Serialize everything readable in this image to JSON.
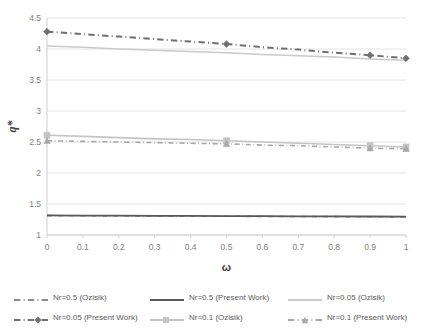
{
  "chart_data": {
    "type": "line",
    "title": "",
    "xlabel": "ω",
    "ylabel": "q*",
    "xlim": [
      0,
      1
    ],
    "ylim": [
      1,
      4.5
    ],
    "ytick_step": 0.5,
    "xtick_step": 0.1,
    "grid": "horizontal",
    "legend_position": "bottom",
    "x": [
      0,
      0.1,
      0.2,
      0.3,
      0.4,
      0.5,
      0.6,
      0.7,
      0.8,
      0.9,
      1
    ],
    "xticks": [
      "0",
      "0.1",
      "0.2",
      "0.3",
      "0.4",
      "0.5",
      "0.6",
      "0.7",
      "0.8",
      "0.9",
      "1"
    ],
    "yticks": [
      "1",
      "1.5",
      "2",
      "2.5",
      "3",
      "3.5",
      "4",
      "4.5"
    ],
    "series": [
      {
        "name": "Nr=0.5 (Ozisik)",
        "color": "#8c8c8c",
        "style": "dash-dot",
        "marker": "none",
        "width": 1.6,
        "values": [
          1.312,
          1.31,
          1.308,
          1.306,
          1.304,
          1.302,
          1.3,
          1.298,
          1.296,
          1.294,
          1.292
        ]
      },
      {
        "name": "Nr=0.5 (Present Work)",
        "color": "#595959",
        "style": "solid",
        "marker": "none",
        "width": 1.8,
        "values": [
          1.316,
          1.314,
          1.312,
          1.31,
          1.308,
          1.306,
          1.304,
          1.302,
          1.3,
          1.298,
          1.296
        ]
      },
      {
        "name": "Nr=0.05 (Ozisik)",
        "color": "#c9c9c9",
        "style": "solid",
        "marker": "none",
        "width": 1.5,
        "values": [
          4.05,
          4.03,
          4.0,
          3.98,
          3.96,
          3.94,
          3.91,
          3.89,
          3.87,
          3.84,
          3.82
        ]
      },
      {
        "name": "Nr=0.05 (Present Work)",
        "color": "#707070",
        "style": "dash-dot",
        "marker": "diamond",
        "width": 2.0,
        "values": [
          4.28,
          4.24,
          4.2,
          4.16,
          4.12,
          4.08,
          4.03,
          3.99,
          3.94,
          3.9,
          3.85
        ],
        "marker_x": [
          0,
          0.5,
          0.9,
          1
        ]
      },
      {
        "name": "Nr=0.1 (Ozisik)",
        "color": "#c4c4c4",
        "style": "solid",
        "marker": "square",
        "width": 1.6,
        "values": [
          2.61,
          2.59,
          2.57,
          2.55,
          2.54,
          2.52,
          2.5,
          2.48,
          2.46,
          2.44,
          2.42
        ],
        "marker_x": [
          0,
          0.5,
          0.9,
          1
        ]
      },
      {
        "name": "Nr=0.1 (Present Work)",
        "color": "#a8a8a8",
        "style": "dash-dot",
        "marker": "triangle",
        "width": 1.6,
        "values": [
          2.52,
          2.51,
          2.5,
          2.49,
          2.48,
          2.47,
          2.45,
          2.44,
          2.42,
          2.4,
          2.39
        ],
        "marker_x": [
          0,
          0.5,
          0.9,
          1
        ]
      }
    ],
    "legend": [
      {
        "label": "Nr=0.5 (Ozisik)",
        "color": "#8c8c8c",
        "style": "dash-dot",
        "marker": "none"
      },
      {
        "label": "Nr=0.5 (Present Work)",
        "color": "#595959",
        "style": "solid",
        "marker": "none"
      },
      {
        "label": "Nr=0.05 (Ozisik)",
        "color": "#c9c9c9",
        "style": "solid",
        "marker": "none"
      },
      {
        "label": "Nr=0.05 (Present Work)",
        "color": "#707070",
        "style": "dash-dot",
        "marker": "diamond"
      },
      {
        "label": "Nr=0.1 (Ozisik)",
        "color": "#c4c4c4",
        "style": "solid",
        "marker": "square"
      },
      {
        "label": "Nr=0.1 (Present Work)",
        "color": "#a8a8a8",
        "style": "dash-dot",
        "marker": "triangle"
      }
    ]
  },
  "plot": {
    "left": 47,
    "right": 406,
    "top": 18,
    "bottom": 235,
    "grid_color": "#e4e4e4",
    "axis_color": "#d0d0d0"
  }
}
